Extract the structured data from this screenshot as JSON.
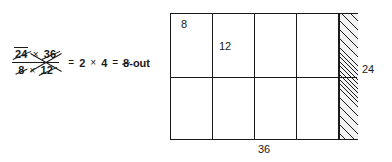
{
  "figure": {
    "type": "arithmetic-cancellation-with-area-model",
    "background_color": "#ffffff",
    "ink_color": "#1a1a1a"
  },
  "expression": {
    "fraction": {
      "numerator": {
        "left_term": "24",
        "operator": "×",
        "right_term": "36",
        "left_term_struck": true,
        "right_term_struck": true
      },
      "denominator": {
        "left_term": "8",
        "operator": "×",
        "right_term": "12",
        "left_term_struck": true,
        "right_term_struck": true
      }
    },
    "equals_1": "=",
    "result_left": "2",
    "result_operator": "×",
    "result_right": "4",
    "equals_2": "=",
    "final_value": "8",
    "final_annotation": "-out",
    "final_value_struck": true
  },
  "diagram": {
    "width_label": "36",
    "height_label": "24",
    "cell_labels": {
      "top_left": "8",
      "second": "12"
    },
    "columns": 5,
    "rows": 2,
    "hatched_column_index": 4,
    "hatched_fill": "#f2f2f2",
    "border_color": "#1a1a1a"
  }
}
